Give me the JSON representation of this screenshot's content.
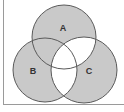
{
  "diagram": {
    "type": "venn",
    "sets": [
      {
        "id": "A",
        "label": "A",
        "cx": 64,
        "cy": 37,
        "r": 32,
        "label_x": 63,
        "label_y": 31
      },
      {
        "id": "B",
        "label": "B",
        "cx": 45,
        "cy": 70,
        "r": 32,
        "label_x": 33,
        "label_y": 74
      },
      {
        "id": "C",
        "label": "C",
        "cx": 84,
        "cy": 70,
        "r": 33,
        "label_x": 89,
        "label_y": 74
      }
    ],
    "regions": {
      "A_only": "shaded",
      "B_only": "shaded",
      "C_only": "shaded",
      "A_and_B_only": "shaded",
      "A_and_C_only": "unshaded",
      "B_and_C_only": "unshaded",
      "A_and_B_and_C": "unshaded"
    },
    "colors": {
      "shade": "#c9c9c9",
      "stroke": "#5a5a5a",
      "background": "#ffffff",
      "frame": "#9a9a9a"
    }
  }
}
